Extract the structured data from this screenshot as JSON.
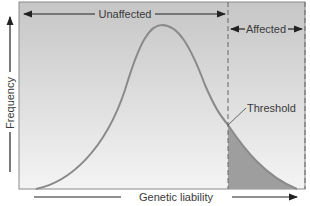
{
  "diagram": {
    "labels": {
      "unaffected": "Unaffected",
      "affected": "Affected",
      "threshold": "Threshold",
      "x_axis": "Genetic liability",
      "y_axis": "Frequency"
    },
    "colors": {
      "background_top": "#c9c9c9",
      "background_bottom": "#f2f2f2",
      "curve": "#8a8a8a",
      "affected_fill": "#9e9e9e",
      "frame": "#8a8a8a",
      "text": "#3a3a3a"
    }
  }
}
